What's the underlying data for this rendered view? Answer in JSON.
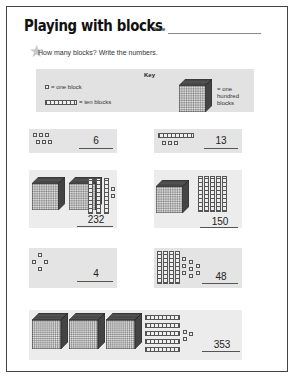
{
  "header": {
    "title": "Playing with blocks",
    "name_label": "Name"
  },
  "instructions": {
    "star_icon": "star-icon",
    "text": "How many blocks? Write the numbers."
  },
  "key": {
    "title": "Key",
    "one_block": "= one block",
    "ten_blocks": "= ten blocks",
    "hundred_blocks": "= one hundred blocks"
  },
  "problems": [
    {
      "hundreds": 0,
      "tens": 0,
      "ones": 6,
      "answer": "6"
    },
    {
      "hundreds": 0,
      "tens": 1,
      "ones": 3,
      "answer": "13"
    },
    {
      "hundreds": 2,
      "tens": 3,
      "ones": 2,
      "answer": "232"
    },
    {
      "hundreds": 1,
      "tens": 5,
      "ones": 0,
      "answer": "150"
    },
    {
      "hundreds": 0,
      "tens": 0,
      "ones": 4,
      "answer": "4"
    },
    {
      "hundreds": 0,
      "tens": 4,
      "ones": 8,
      "answer": "48"
    },
    {
      "hundreds": 3,
      "tens": 5,
      "ones": 3,
      "answer": "353"
    }
  ],
  "colors": {
    "panel_bg": "#e4e4e4",
    "key_bg": "#e2e2e2",
    "border": "#444444"
  }
}
